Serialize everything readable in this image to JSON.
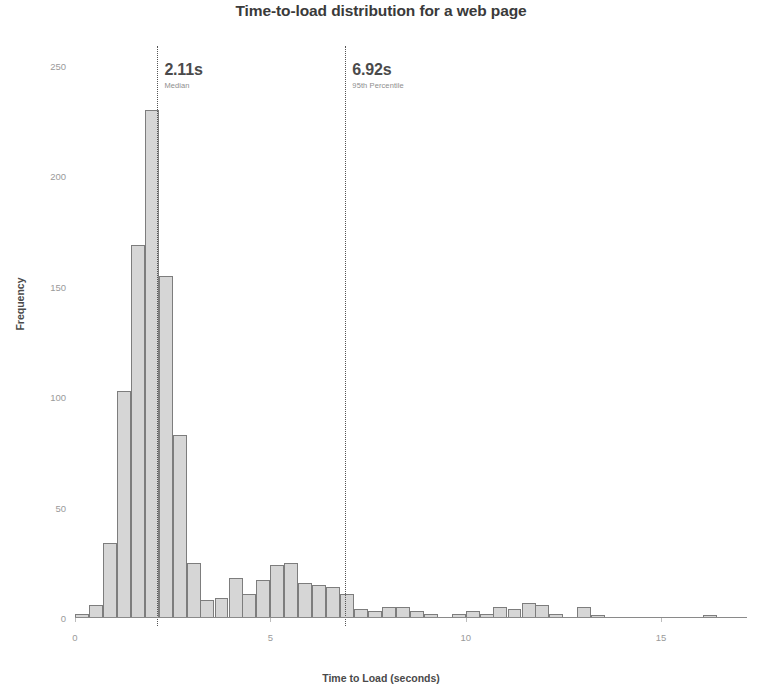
{
  "chart_data": {
    "type": "bar",
    "title": "Time-to-load distribution for a web page",
    "xlabel": "Time to Load (seconds)",
    "ylabel": "Frequency",
    "xlim": [
      0,
      17.2
    ],
    "ylim": [
      0,
      255
    ],
    "grid": false,
    "legend": null,
    "bin_width": 0.357,
    "xticks": [
      0,
      5,
      10,
      15
    ],
    "xtick_labels": [
      "0",
      "5",
      "10",
      "15"
    ],
    "yticks": [
      0,
      50,
      100,
      150,
      200,
      250
    ],
    "ytick_labels": [
      "0",
      "50",
      "100",
      "150",
      "200",
      "250"
    ],
    "bar_color": "#d6d6d6",
    "bar_edge_color": "#7d7d7d",
    "x": [
      0.18,
      0.54,
      0.89,
      1.25,
      1.61,
      1.96,
      2.32,
      2.68,
      3.04,
      3.39,
      3.75,
      4.11,
      4.46,
      4.82,
      5.18,
      5.54,
      5.89,
      6.25,
      6.61,
      6.96,
      7.32,
      7.68,
      8.04,
      8.39,
      8.75,
      9.11,
      9.46,
      9.82,
      10.18,
      10.54,
      10.89,
      11.25,
      11.61,
      11.96,
      12.32,
      12.68,
      13.04,
      13.39,
      13.75,
      14.11,
      14.46,
      14.82,
      15.18,
      15.54,
      15.89,
      16.25,
      16.61
    ],
    "values": [
      2,
      6,
      34,
      103,
      169,
      230,
      155,
      83,
      25,
      8,
      9,
      18,
      11,
      17,
      24,
      25,
      16,
      15,
      14,
      11,
      4,
      3,
      5,
      5,
      3,
      2,
      0,
      2,
      3,
      2,
      5,
      4,
      7,
      6,
      2,
      0,
      5,
      1,
      0,
      0,
      0,
      0,
      0,
      0,
      0,
      1,
      0
    ],
    "annotations": [
      {
        "name": "median",
        "x": 2.11,
        "value_label": "2.11s",
        "sub_label": "Median",
        "line_style": "dotted"
      },
      {
        "name": "p95",
        "x": 6.92,
        "value_label": "6.92s",
        "sub_label": "95th Percentile",
        "line_style": "dotted"
      }
    ]
  },
  "chart": {
    "title": "Time-to-load distribution for a web page",
    "x_axis_title": "Time to Load (seconds)",
    "y_axis_title": "Frequency"
  }
}
